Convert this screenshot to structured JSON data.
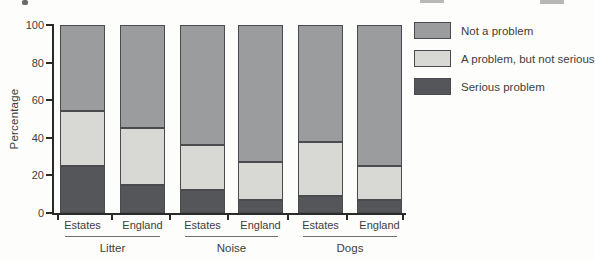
{
  "chart_data": {
    "type": "bar",
    "stacked": true,
    "title": "",
    "ylabel": "Percentage",
    "ylim": [
      0,
      100
    ],
    "yticks": [
      0,
      20,
      40,
      60,
      80,
      100
    ],
    "grid": false,
    "legend_position": "right",
    "group_labels": [
      "Litter",
      "Noise",
      "Dogs"
    ],
    "bar_labels": [
      "Estates",
      "England",
      "Estates",
      "England",
      "Estates",
      "England"
    ],
    "series": [
      {
        "name": "Serious problem",
        "color": "#55565a",
        "values": [
          25,
          15,
          12,
          7,
          9,
          7
        ]
      },
      {
        "name": "A problem, but not serious",
        "color": "#d8d9d5",
        "values": [
          29,
          30,
          24,
          20,
          29,
          18
        ]
      },
      {
        "name": "Not a problem",
        "color": "#9a9c9e",
        "values": [
          46,
          55,
          64,
          73,
          62,
          75
        ]
      }
    ],
    "legend": [
      {
        "label": "Not a problem",
        "color": "#9a9c9e"
      },
      {
        "label": "A problem, but not serious",
        "color": "#d8d9d5"
      },
      {
        "label": "Serious problem",
        "color": "#55565a"
      }
    ]
  },
  "colors": {
    "axis": "#2a2a2a",
    "segment_border": "#4a4b4f",
    "text": "#3d3d3d",
    "background": "#fdfdfb"
  }
}
